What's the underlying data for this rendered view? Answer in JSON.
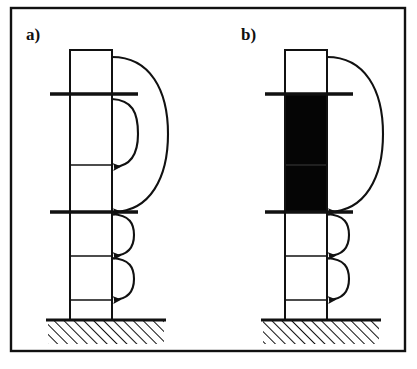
{
  "figure": {
    "type": "engineering-diagram",
    "background_color": "#ffffff",
    "line_color": "#111111",
    "fill_color": "#000000",
    "border": {
      "visible": true,
      "color": "#111111",
      "thickness": 2
    },
    "panels": [
      {
        "id": "panel-a",
        "label": "a)",
        "label_x": 26,
        "label_y": 40,
        "column": {
          "x": 70,
          "width": 42,
          "top": 50,
          "bottom": 320,
          "dividers": [
            94,
            165,
            212,
            256,
            300
          ],
          "filled_segments": []
        },
        "rules": [
          {
            "y": 94,
            "x1": 50,
            "x2": 138
          },
          {
            "y": 212,
            "x1": 50,
            "x2": 138
          }
        ],
        "arcs": [
          {
            "name": "large-arc",
            "from_y": 57,
            "to_y": 212,
            "radius_x": 56,
            "arrow": true
          },
          {
            "name": "mid-arc",
            "from_y": 101,
            "to_y": 167,
            "radius_x": 26,
            "arrow": true
          },
          {
            "name": "small-arc-upper",
            "from_y": 214,
            "to_y": 256,
            "radius_x": 20,
            "arrow": true
          },
          {
            "name": "small-arc-lower",
            "from_y": 258,
            "to_y": 300,
            "radius_x": 20,
            "arrow": true
          }
        ],
        "ground": {
          "x": 48,
          "width": 116,
          "y": 320,
          "height": 24,
          "hatch": "diagonal-45"
        }
      },
      {
        "id": "panel-b",
        "label": "b)",
        "label_x": 241,
        "label_y": 40,
        "column": {
          "x": 285,
          "width": 42,
          "top": 50,
          "bottom": 320,
          "dividers": [
            94,
            165,
            212,
            256,
            300
          ],
          "filled_segments": [
            {
              "from_y": 94,
              "to_y": 165
            },
            {
              "from_y": 165,
              "to_y": 212
            }
          ]
        },
        "rules": [
          {
            "y": 94,
            "x1": 265,
            "x2": 353
          },
          {
            "y": 212,
            "x1": 265,
            "x2": 353
          }
        ],
        "arcs": [
          {
            "name": "large-arc",
            "from_y": 57,
            "to_y": 212,
            "radius_x": 56,
            "arrow": true
          },
          {
            "name": "small-arc-upper",
            "from_y": 214,
            "to_y": 256,
            "radius_x": 20,
            "arrow": true
          },
          {
            "name": "small-arc-lower",
            "from_y": 258,
            "to_y": 300,
            "radius_x": 20,
            "arrow": true
          }
        ],
        "ground": {
          "x": 263,
          "width": 116,
          "y": 320,
          "height": 24,
          "hatch": "diagonal-45"
        }
      }
    ]
  }
}
